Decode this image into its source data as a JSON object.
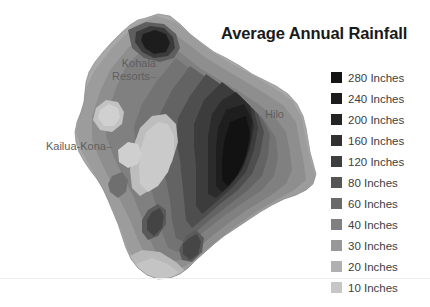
{
  "title": "Average Annual Rainfall",
  "background_color": "#ffffff",
  "map": {
    "region_name": "Hawaii Island",
    "labels": [
      {
        "id": "kohala-resorts",
        "text": "Kohala\nResorts",
        "leader": "–"
      },
      {
        "id": "kailua-kona",
        "text": "Kailua-Kona",
        "leader": "–"
      },
      {
        "id": "hilo",
        "text": "Hilo",
        "leader": ""
      }
    ],
    "label_kohala_line1": "Kohala",
    "label_kohala_line2": "Resorts",
    "label_kailua": "Kailua-Kona",
    "label_hilo": "Hilo",
    "leader_dash": "–"
  },
  "legend": {
    "unit": "Inches",
    "items": [
      {
        "value": "280",
        "label": "280 Inches",
        "color": "#141414"
      },
      {
        "value": "240",
        "label": "240 Inches",
        "color": "#1c1c1c"
      },
      {
        "value": "200",
        "label": "200 Inches",
        "color": "#242424"
      },
      {
        "value": "160",
        "label": "160 Inches",
        "color": "#303030"
      },
      {
        "value": "120",
        "label": "120 Inches",
        "color": "#3e3e3e"
      },
      {
        "value": "80",
        "label": "80 Inches",
        "color": "#555555"
      },
      {
        "value": "60",
        "label": "60 Inches",
        "color": "#6a6a6a"
      },
      {
        "value": "40",
        "label": "40 Inches",
        "color": "#808080"
      },
      {
        "value": "30",
        "label": "30 Inches",
        "color": "#989898"
      },
      {
        "value": "20",
        "label": "20 Inches",
        "color": "#b0b0b0"
      },
      {
        "value": "10",
        "label": "10 Inches",
        "color": "#c6c6c6"
      }
    ]
  },
  "chart_data": {
    "type": "heatmap",
    "title": "Average Annual Rainfall",
    "subtitle": "",
    "xlabel": "",
    "ylabel": "",
    "legend_position": "right",
    "grid": false,
    "colorbar_unit": "Inches",
    "colorbar_levels": [
      280,
      240,
      200,
      160,
      120,
      80,
      60,
      40,
      30,
      20,
      10
    ],
    "colorbar_colors": [
      "#141414",
      "#1c1c1c",
      "#242424",
      "#303030",
      "#3e3e3e",
      "#555555",
      "#6a6a6a",
      "#808080",
      "#989898",
      "#b0b0b0",
      "#c6c6c6"
    ],
    "annotations": [
      "Kohala Resorts",
      "Kailua-Kona",
      "Hilo"
    ],
    "regions": [
      {
        "name": "Hilo / windward east coast",
        "value": 280
      },
      {
        "name": "North Kohala summit",
        "value": 240
      },
      {
        "name": "Hamakua coast",
        "value": 160
      },
      {
        "name": "Puna district",
        "value": 120
      },
      {
        "name": "Saddle / interior",
        "value": 40
      },
      {
        "name": "Kailua-Kona leeward",
        "value": 30
      },
      {
        "name": "Kohala Resorts leeward",
        "value": 10
      },
      {
        "name": "Ka Lae southern tip",
        "value": 20
      }
    ]
  }
}
